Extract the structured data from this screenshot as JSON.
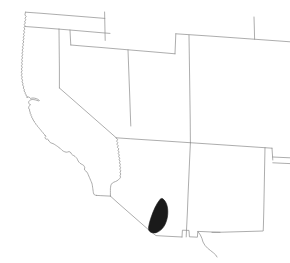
{
  "figure": {
    "type": "range-map",
    "width": 290,
    "height": 263,
    "background_color": "#ffffff",
    "title": "",
    "caption": ""
  },
  "style": {
    "border_color": "#8a8a8a",
    "border_width": 0.7,
    "range_fill_color": "#1a1a1a",
    "range_stroke_color": "#1a1a1a",
    "coast_color": "#8a8a8a"
  },
  "region": {
    "name": "Southwestern United States",
    "states_depicted": [
      "Oregon",
      "Idaho",
      "Wyoming",
      "California",
      "Nevada",
      "Utah",
      "Colorado",
      "Arizona",
      "New Mexico",
      "Texas",
      "Kansas",
      "Oklahoma"
    ]
  },
  "range": {
    "label": "highlighted-range",
    "fill_color": "#1a1a1a",
    "location_description": "southwestern Arizona",
    "bounds_px": {
      "x": 148,
      "y": 199,
      "width": 20,
      "height": 34
    },
    "area_note": "single contiguous shaded polygon"
  },
  "layers": [
    {
      "name": "state-borders",
      "visible": true
    },
    {
      "name": "coastline",
      "visible": true
    },
    {
      "name": "international-border",
      "visible": true
    },
    {
      "name": "range-overlay",
      "visible": true
    }
  ],
  "legend": {
    "visible": false,
    "entries": []
  },
  "axes": {
    "visible": false,
    "grid": false,
    "tick_labels": []
  }
}
